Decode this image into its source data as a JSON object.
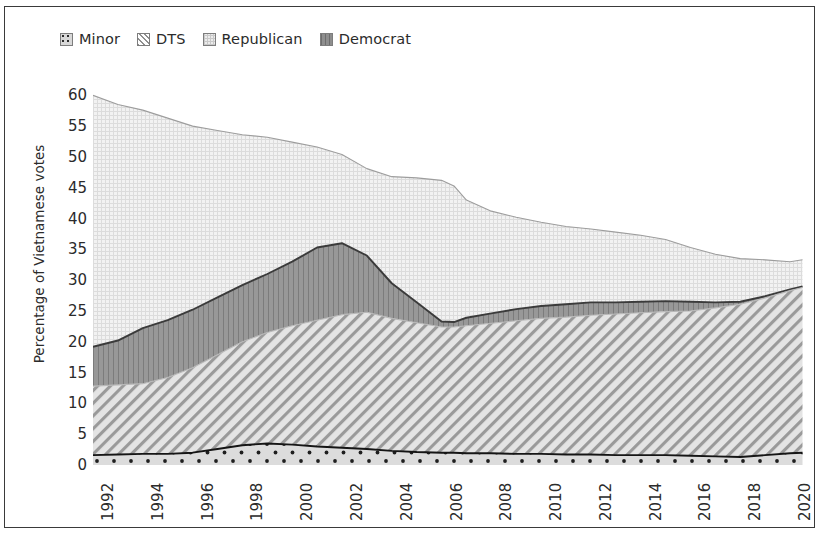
{
  "legend": {
    "items": [
      {
        "label": "Minor",
        "swatch": "minor-dotted-swatch",
        "color": "#d8d8d8"
      },
      {
        "label": "DTS",
        "swatch": "dts-hatched-swatch",
        "color": "#8f8f8f"
      },
      {
        "label": "Republican",
        "swatch": "republican-stippled-swatch",
        "color": "#ececec"
      },
      {
        "label": "Democrat",
        "swatch": "democrat-solid-swatch",
        "color": "#8e8e8e"
      }
    ]
  },
  "axes": {
    "ylabel": "Percentage of Vietnamese votes",
    "yticks": [
      "0",
      "5",
      "10",
      "15",
      "20",
      "25",
      "30",
      "35",
      "40",
      "45",
      "50",
      "55",
      "60"
    ],
    "xticks": [
      "1992",
      "1994",
      "1996",
      "1998",
      "2000",
      "2002",
      "2004",
      "2006",
      "2008",
      "2010",
      "2012",
      "2014",
      "2016",
      "2018",
      "2020"
    ]
  },
  "chart_data": {
    "type": "area",
    "title": "",
    "xlabel": "",
    "ylabel": "Percentage of Vietnamese votes",
    "xlim": [
      1992,
      2020.6
    ],
    "ylim": [
      0,
      62
    ],
    "grid": false,
    "stacked": true,
    "legend_position": "top-left",
    "stack_order_bottom_to_top": [
      "Minor",
      "DTS",
      "Democrat",
      "Republican"
    ],
    "x": [
      1992,
      1993,
      1994,
      1995,
      1996,
      1997,
      1998,
      1999,
      2000,
      2001,
      2002,
      2003,
      2004,
      2005,
      2006,
      2006.5,
      2007,
      2008,
      2009,
      2010,
      2011,
      2012,
      2013,
      2014,
      2015,
      2016,
      2017,
      2018,
      2019,
      2020,
      2020.5
    ],
    "series": [
      {
        "name": "Minor",
        "pattern": "dotted",
        "color": "#d8d8d8",
        "values": [
          1.6,
          1.7,
          1.8,
          1.8,
          2.0,
          2.6,
          3.2,
          3.5,
          3.3,
          3.0,
          2.8,
          2.6,
          2.3,
          2.1,
          2.0,
          2.0,
          1.9,
          1.9,
          1.8,
          1.8,
          1.7,
          1.7,
          1.6,
          1.6,
          1.6,
          1.5,
          1.4,
          1.3,
          1.6,
          1.9,
          2.0
        ]
      },
      {
        "name": "DTS",
        "pattern": "diagonal-hatch",
        "color": "#8f8f8f",
        "values": [
          11.2,
          11.3,
          11.4,
          12.4,
          13.8,
          15.3,
          16.8,
          18.0,
          19.3,
          20.5,
          21.6,
          22.2,
          21.5,
          21.0,
          20.4,
          20.4,
          20.7,
          21.1,
          21.6,
          22.0,
          22.3,
          22.6,
          22.9,
          23.1,
          23.3,
          23.5,
          24.1,
          24.8,
          25.5,
          26.4,
          26.8
        ]
      },
      {
        "name": "Democrat",
        "pattern": "solid",
        "color": "#8e8e8e",
        "values": [
          6.4,
          7.2,
          9.0,
          9.3,
          9.4,
          9.3,
          9.2,
          9.5,
          10.4,
          11.8,
          11.6,
          9.2,
          5.7,
          3.3,
          0.9,
          0.8,
          1.3,
          1.6,
          1.9,
          2.0,
          2.1,
          2.1,
          1.9,
          1.8,
          1.7,
          1.5,
          0.9,
          0.4,
          0.3,
          0.2,
          0.2
        ]
      },
      {
        "name": "Republican",
        "pattern": "stipple",
        "color": "#ececec",
        "values": [
          40.8,
          38.3,
          35.4,
          32.8,
          29.8,
          27.1,
          24.4,
          22.2,
          19.4,
          16.3,
          14.4,
          14.1,
          17.3,
          20.2,
          22.9,
          22.1,
          19.1,
          16.6,
          14.9,
          13.6,
          12.6,
          11.9,
          11.4,
          10.8,
          10.0,
          8.8,
          7.8,
          7.0,
          5.9,
          4.5,
          4.3
        ]
      }
    ],
    "cumulative_totals": [
      60.0,
      58.5,
      57.6,
      56.3,
      55.0,
      54.3,
      53.6,
      53.2,
      52.4,
      51.6,
      50.4,
      48.1,
      46.8,
      46.6,
      46.2,
      45.3,
      43.0,
      41.2,
      40.2,
      39.4,
      38.7,
      38.3,
      37.8,
      37.3,
      36.6,
      35.3,
      34.2,
      33.5,
      33.3,
      33.0,
      33.3
    ]
  }
}
